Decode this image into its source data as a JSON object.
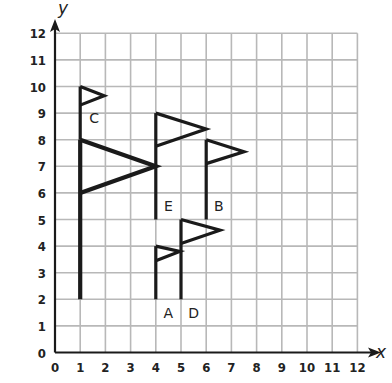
{
  "diagram": {
    "x_axis": {
      "label": "x",
      "min": 0,
      "max": 12,
      "ticks": [
        "0",
        "1",
        "2",
        "3",
        "4",
        "5",
        "6",
        "7",
        "8",
        "9",
        "10",
        "11",
        "12"
      ]
    },
    "y_axis": {
      "label": "y",
      "min": 0,
      "max": 12,
      "ticks": [
        "0",
        "1",
        "2",
        "3",
        "4",
        "5",
        "6",
        "7",
        "8",
        "9",
        "10",
        "11",
        "12"
      ]
    },
    "grid": true,
    "colors": {
      "grid": "#b8b8b8",
      "ink": "#1a1a1a"
    },
    "flags": [
      {
        "name": "C",
        "label": "C",
        "pole": [
          [
            1,
            2
          ],
          [
            1,
            8
          ]
        ],
        "flag": [
          [
            1,
            8
          ],
          [
            4,
            7
          ],
          [
            1,
            6
          ]
        ],
        "label_pos": [
          1.55,
          8.8
        ],
        "thick": true
      },
      {
        "name": "top-small",
        "label": "",
        "pole": [
          [
            1,
            8
          ],
          [
            1,
            10
          ]
        ],
        "flag": [
          [
            1,
            10
          ],
          [
            1.95,
            9.65
          ],
          [
            1,
            9.3
          ]
        ],
        "thick": false
      },
      {
        "name": "E",
        "label": "E",
        "pole": [
          [
            4,
            5
          ],
          [
            4,
            9
          ]
        ],
        "flag": [
          [
            4,
            9
          ],
          [
            6,
            8.4
          ],
          [
            4,
            7.75
          ]
        ],
        "label_pos": [
          4.5,
          5.5
        ],
        "thick": false
      },
      {
        "name": "B",
        "label": "B",
        "pole": [
          [
            6,
            5
          ],
          [
            6,
            8
          ]
        ],
        "flag": [
          [
            6,
            8
          ],
          [
            7.5,
            7.55
          ],
          [
            6,
            7.1
          ]
        ],
        "label_pos": [
          6.5,
          5.5
        ],
        "thick": false
      },
      {
        "name": "A",
        "label": "A",
        "pole": [
          [
            4,
            2
          ],
          [
            4,
            4
          ]
        ],
        "flag": [
          [
            4,
            4
          ],
          [
            4.95,
            3.8
          ],
          [
            4,
            3.45
          ]
        ],
        "label_pos": [
          4.5,
          1.5
        ],
        "thick": false
      },
      {
        "name": "D",
        "label": "D",
        "pole": [
          [
            5,
            2
          ],
          [
            5,
            5
          ]
        ],
        "flag": [
          [
            5,
            5
          ],
          [
            6.55,
            4.6
          ],
          [
            5,
            4.1
          ]
        ],
        "label_pos": [
          5.5,
          1.5
        ],
        "thick": false
      }
    ]
  }
}
